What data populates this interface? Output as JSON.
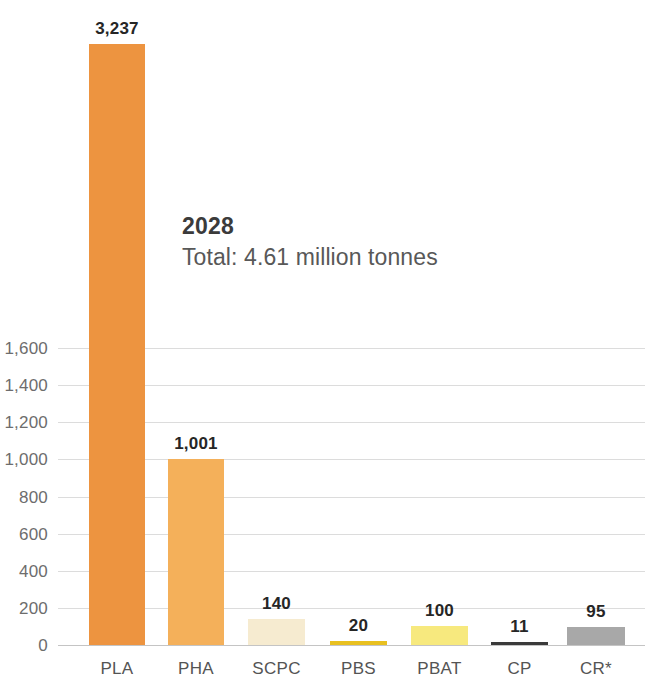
{
  "chart_data": {
    "type": "bar",
    "title": "",
    "subtitle": "",
    "xlabel": "",
    "ylabel": "",
    "categories": [
      "PLA",
      "PHA",
      "SCPC",
      "PBS",
      "PBAT",
      "CP",
      "CR*"
    ],
    "values": [
      3237,
      1001,
      140,
      20,
      100,
      11,
      95
    ],
    "value_labels": [
      "3,237",
      "1,001",
      "140",
      "20",
      "100",
      "11",
      "95"
    ],
    "bar_colors": [
      "#ED9440",
      "#F4B05A",
      "#F6EBD0",
      "#E8C020",
      "#F7E97E",
      "#3A3A3A",
      "#A8A8A8"
    ],
    "ylim": [
      0,
      1600
    ],
    "ytick_values": [
      0,
      200,
      400,
      600,
      800,
      1000,
      1200,
      1400,
      1600
    ],
    "ytick_labels": [
      "0",
      "200",
      "400",
      "600",
      "800",
      "1,000",
      "1,200",
      "1,400",
      "1,600"
    ],
    "grid": true,
    "legend": "none",
    "annotations": [
      {
        "year": "2028",
        "total": "Total: 4.61 million tonnes"
      }
    ]
  },
  "annotation": {
    "year": "2028",
    "total": "Total: 4.61 million tonnes"
  }
}
